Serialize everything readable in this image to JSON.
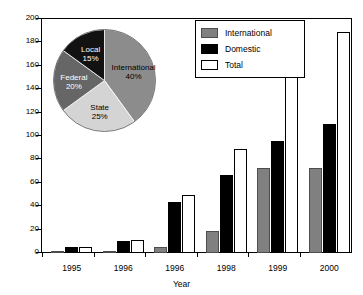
{
  "chart_data": {
    "type": "bar",
    "title": "",
    "xlabel": "Year",
    "ylabel": "",
    "ylim": [
      0,
      200
    ],
    "ytick_step": 20,
    "yticks": [
      "0",
      "20",
      "40",
      "60",
      "80",
      "100",
      "120",
      "140",
      "160",
      "180",
      "200"
    ],
    "categories": [
      "1995",
      "1996",
      "1996",
      "1998",
      "1999",
      "2000"
    ],
    "grid": false,
    "legend_position": "top-right",
    "series": [
      {
        "name": "International",
        "color": "#808080",
        "values": [
          0,
          2,
          5,
          19,
          73,
          73
        ]
      },
      {
        "name": "Domestic",
        "color": "#000000",
        "values": [
          5,
          10,
          44,
          67,
          96,
          110
        ]
      },
      {
        "name": "Total",
        "color": "#ffffff",
        "values": [
          5,
          11,
          50,
          89,
          175,
          189
        ]
      }
    ],
    "inset_chart": {
      "type": "pie",
      "slices": [
        {
          "label": "International",
          "percent": 40,
          "percent_text": "40%",
          "color": "#8c8c8c",
          "text_color": "on-light"
        },
        {
          "label": "State",
          "percent": 25,
          "percent_text": "25%",
          "color": "#d4d4d4",
          "text_color": "on-light"
        },
        {
          "label": "Federal",
          "percent": 20,
          "percent_text": "20%",
          "color": "#666666",
          "text_color": "on-dark"
        },
        {
          "label": "Local",
          "percent": 15,
          "percent_text": "15%",
          "color": "#121212",
          "text_color": "on-dark"
        }
      ]
    }
  },
  "legend": {
    "items": [
      {
        "label": "International"
      },
      {
        "label": "Domestic"
      },
      {
        "label": "Total"
      }
    ]
  }
}
